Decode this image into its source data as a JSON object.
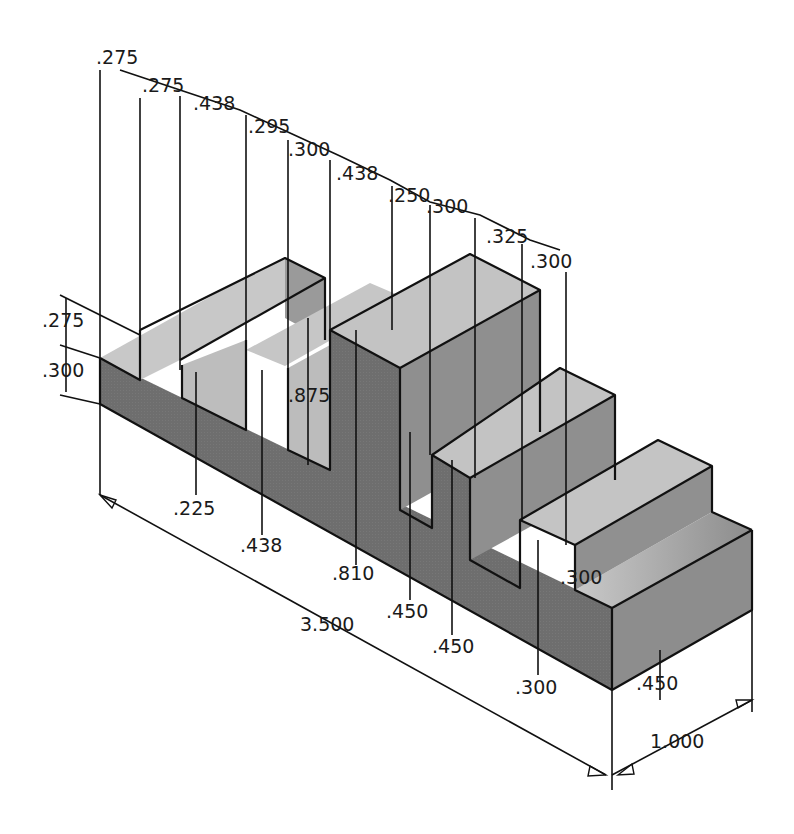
{
  "colors": {
    "background": "#ffffff",
    "top_face": "#c4c4c4",
    "front_face": "#6e6e6e",
    "side_face": "#8a8a8a",
    "inner_face": "#b8b8b8",
    "line": "#111111"
  },
  "drawing": {
    "type": "isometric-dimensioned-part",
    "overall": {
      "length": "3.500",
      "depth": "1.000"
    },
    "top_dimensions": [
      {
        "label": ".275",
        "x": 96,
        "y": 64
      },
      {
        "label": ".275",
        "x": 142,
        "y": 92
      },
      {
        "label": ".438",
        "x": 193,
        "y": 110
      },
      {
        "label": ".295",
        "x": 248,
        "y": 133
      },
      {
        "label": ".300",
        "x": 288,
        "y": 156
      },
      {
        "label": ".438",
        "x": 336,
        "y": 180
      },
      {
        "label": ".250",
        "x": 388,
        "y": 202
      },
      {
        "label": ".300",
        "x": 426,
        "y": 213
      },
      {
        "label": ".325",
        "x": 486,
        "y": 243
      },
      {
        "label": ".300",
        "x": 530,
        "y": 268
      }
    ],
    "left_dimensions": [
      {
        "label": ".275",
        "x": 42,
        "y": 327
      },
      {
        "label": ".300",
        "x": 42,
        "y": 377
      }
    ],
    "depth_dimensions": [
      {
        "label": ".875",
        "x": 288,
        "y": 402
      },
      {
        "label": ".225",
        "x": 173,
        "y": 515
      },
      {
        "label": ".438",
        "x": 240,
        "y": 552
      },
      {
        "label": ".810",
        "x": 332,
        "y": 580
      },
      {
        "label": ".450",
        "x": 386,
        "y": 618
      },
      {
        "label": ".450",
        "x": 432,
        "y": 653
      },
      {
        "label": ".300",
        "x": 515,
        "y": 694
      },
      {
        "label": ".300",
        "x": 560,
        "y": 584
      },
      {
        "label": ".450",
        "x": 636,
        "y": 690
      }
    ],
    "overall_dimensions": [
      {
        "label": "3.500",
        "x": 300,
        "y": 631
      },
      {
        "label": "1.000",
        "x": 650,
        "y": 748
      }
    ]
  }
}
